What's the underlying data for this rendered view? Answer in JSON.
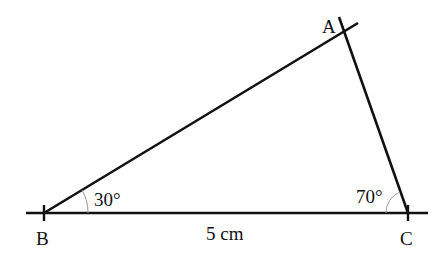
{
  "diagram": {
    "type": "triangle",
    "vertices": {
      "A": {
        "label": "A"
      },
      "B": {
        "label": "B"
      },
      "C": {
        "label": "C"
      }
    },
    "angles": {
      "B": "30°",
      "C": "70°"
    },
    "sides": {
      "BC": "5 cm"
    },
    "colors": {
      "line": "#111111",
      "arc": "#999999"
    }
  }
}
